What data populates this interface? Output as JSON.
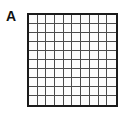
{
  "figure": {
    "width": 127,
    "height": 115,
    "background_color": "#ffffff"
  },
  "panel": {
    "label": "A",
    "label_color": "#111111"
  },
  "grid": {
    "columns": 10,
    "rows": 10,
    "cell_count": 100,
    "border_color": "#1a1a1a",
    "line_color": "#4a4a4a",
    "cell_fill_color": "#fbfbfb",
    "border_width_px": 2,
    "line_width_px": 1,
    "left_px": 27,
    "top_px": 13,
    "width_px": 91,
    "height_px": 94
  }
}
